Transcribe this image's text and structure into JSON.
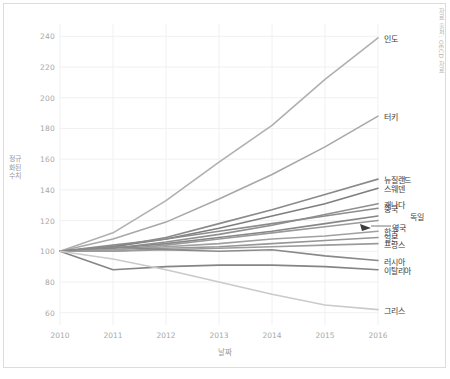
{
  "figure": {
    "source_note": "자료 출처: OECD 자료",
    "background": "#ffffff",
    "border_color": "#dcdcdc"
  },
  "chart_data": {
    "type": "line",
    "title": "",
    "xlabel": "날짜",
    "ylabel": "정규화된 수치",
    "x": [
      2010,
      2011,
      2012,
      2013,
      2014,
      2015,
      2016
    ],
    "xtick_labels": [
      "2010",
      "2011",
      "2012",
      "2013",
      "2014",
      "2015",
      "2016"
    ],
    "ytick_labels": [
      "60",
      "80",
      "100",
      "120",
      "140",
      "160",
      "180",
      "200",
      "220",
      "240"
    ],
    "yticks": [
      60,
      80,
      100,
      120,
      140,
      160,
      180,
      200,
      220,
      240
    ],
    "xlim": [
      2010,
      2016
    ],
    "ylim": [
      52,
      248
    ],
    "grid": true,
    "legend_position": "right-inline-labels",
    "series": [
      {
        "name": "인도",
        "color": "#b0b0b0",
        "values": [
          100,
          112,
          133,
          158,
          182,
          212,
          239
        ]
      },
      {
        "name": "터키",
        "color": "#a8a8a8",
        "values": [
          100,
          108,
          119,
          134,
          150,
          168,
          188
        ]
      },
      {
        "name": "뉴질랜드",
        "color": "#8a8a8a",
        "values": [
          100,
          103,
          109,
          118,
          127,
          137,
          147
        ]
      },
      {
        "name": "스웨덴",
        "color": "#7e7e7e",
        "values": [
          100,
          103,
          108,
          115,
          123,
          131,
          141
        ]
      },
      {
        "name": "캐나다",
        "color": "#909090",
        "values": [
          100,
          102,
          106,
          111,
          117,
          124,
          131
        ]
      },
      {
        "name": "중국",
        "color": "#8c8c8c",
        "values": [
          100,
          104,
          108,
          113,
          118,
          123,
          128
        ]
      },
      {
        "name": "독일",
        "color": "#868686",
        "values": [
          100,
          102,
          105,
          109,
          113,
          118,
          123
        ]
      },
      {
        "name": "영국",
        "color": "#9a9a9a",
        "values": [
          100,
          101,
          104,
          108,
          112,
          116,
          120
        ]
      },
      {
        "name": "한국",
        "color": "#a0a0a0",
        "values": [
          100,
          101,
          103,
          105,
          108,
          110,
          113
        ]
      },
      {
        "name": "일본",
        "color": "#979797",
        "values": [
          100,
          100,
          102,
          103,
          105,
          107,
          109
        ]
      },
      {
        "name": "프랑스",
        "color": "#9c9c9c",
        "values": [
          100,
          100,
          101,
          102,
          103,
          104,
          105
        ]
      },
      {
        "name": "러시아",
        "color": "#898989",
        "values": [
          100,
          103,
          101,
          100,
          101,
          97,
          94
        ]
      },
      {
        "name": "이탈리아",
        "color": "#858585",
        "values": [
          100,
          88,
          90,
          91,
          91,
          90,
          88
        ]
      },
      {
        "name": "그리스",
        "color": "#cacaca",
        "values": [
          100,
          95,
          88,
          80,
          72,
          65,
          62
        ]
      }
    ]
  }
}
